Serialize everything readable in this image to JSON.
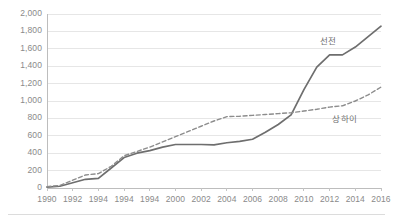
{
  "chart_data": {
    "type": "line",
    "title": "",
    "subtitle": "",
    "xlabel": "",
    "ylabel": "",
    "xlim": [
      1990,
      2016
    ],
    "ylim": [
      0,
      2000
    ],
    "grid": true,
    "gridlines_horizontal": [
      0,
      200,
      400,
      600,
      800,
      1000,
      1200,
      1400,
      1600,
      1800,
      2000
    ],
    "legend_position": "inline-annotation",
    "y_ticks": [
      "0",
      "200",
      "400",
      "600",
      "800",
      "1,000",
      "1,200",
      "1,400",
      "1,600",
      "1,800",
      "2,000"
    ],
    "y_tick_values": [
      0,
      200,
      400,
      600,
      800,
      1000,
      1200,
      1400,
      1600,
      1800,
      2000
    ],
    "x_ticks": [
      "1990",
      "1992",
      "1994",
      "1994",
      "1994",
      "2000",
      "2002",
      "2004",
      "2006",
      "2008",
      "2010",
      "2012",
      "2014",
      "2016"
    ],
    "x_tick_values": [
      1990,
      1992,
      1994,
      1996,
      1998,
      2000,
      2002,
      2004,
      2006,
      2008,
      2010,
      2012,
      2014,
      2016
    ],
    "x": [
      1990,
      1991,
      1992,
      1993,
      1994,
      1995,
      1996,
      1997,
      1998,
      1999,
      2000,
      2001,
      2002,
      2003,
      2004,
      2005,
      2006,
      2007,
      2008,
      2009,
      2010,
      2011,
      2012,
      2013,
      2014,
      2015,
      2016
    ],
    "series": [
      {
        "name": "선전",
        "style": "solid",
        "color": "#6e6e6e",
        "label_x": 2012,
        "label_y": 1700,
        "values": [
          10,
          20,
          60,
          100,
          110,
          230,
          350,
          400,
          430,
          470,
          500,
          500,
          500,
          495,
          520,
          535,
          560,
          640,
          730,
          840,
          1130,
          1390,
          1530,
          1530,
          1620,
          1740,
          1860
        ]
      },
      {
        "name": "상하이",
        "style": "dashed",
        "color": "#8c8c8c",
        "label_x": 2013,
        "label_y": 810,
        "values": [
          15,
          30,
          90,
          150,
          165,
          250,
          370,
          420,
          470,
          530,
          590,
          650,
          710,
          770,
          820,
          825,
          835,
          845,
          855,
          865,
          885,
          905,
          930,
          945,
          1000,
          1070,
          1160
        ]
      }
    ]
  }
}
